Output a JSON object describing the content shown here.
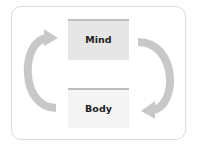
{
  "diagram": {
    "nodes": [
      {
        "id": "mind",
        "label": "Mind",
        "fill": "#e6e6e6",
        "bar": "#bdbdbd"
      },
      {
        "id": "body",
        "label": "Body",
        "fill": "#f4f4f4",
        "bar": "#bdbdbd"
      }
    ],
    "edges": [
      {
        "from": "body",
        "to": "mind",
        "side": "left",
        "style": "curved-arrow"
      },
      {
        "from": "mind",
        "to": "body",
        "side": "right",
        "style": "curved-arrow"
      }
    ],
    "colors": {
      "arrow": "#c8c8c8",
      "frame_border": "#dcdcdc"
    }
  }
}
